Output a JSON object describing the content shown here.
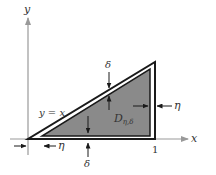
{
  "figure": {
    "type": "region-diagram"
  },
  "axes": {
    "x_label": "x",
    "y_label": "y",
    "x_tick_label": "1"
  },
  "labels": {
    "line": "y = x",
    "region_main": "D",
    "region_sub": "η,δ",
    "delta_top": "δ",
    "delta_bottom": "δ",
    "eta_right": "η",
    "eta_bottom": "η"
  },
  "colors": {
    "axis": "#999999",
    "outline": "#1a1a1a",
    "shade": "#8a8a8a",
    "text": "#333333",
    "background": "#ffffff"
  },
  "geometry": {
    "origin": [
      28,
      139
    ],
    "outer_triangle": [
      [
        28,
        139
      ],
      [
        155,
        139
      ],
      [
        155,
        62
      ]
    ],
    "inner_triangle": [
      [
        42,
        137
      ],
      [
        150,
        137
      ],
      [
        150,
        68
      ]
    ]
  }
}
